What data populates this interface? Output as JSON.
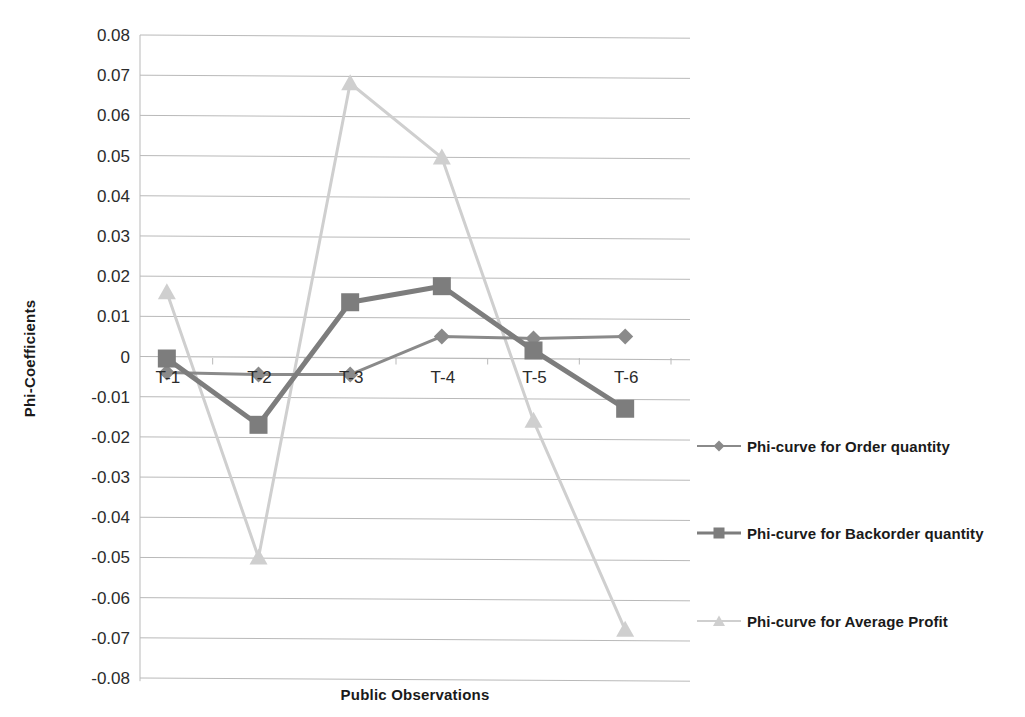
{
  "chart_data": {
    "type": "line",
    "title": "",
    "xlabel": "Public Observations",
    "ylabel": "Phi-Coefficients",
    "categories": [
      "T-1",
      "T-2",
      "T-3",
      "T-4",
      "T-5",
      "T-6"
    ],
    "ylim": [
      -0.08,
      0.08
    ],
    "ytick_labels": [
      "0.08",
      "0.07",
      "0.06",
      "0.05",
      "0.04",
      "0.03",
      "0.02",
      "0.01",
      "0",
      "-0.01",
      "-0.02",
      "-0.03",
      "-0.04",
      "-0.05",
      "-0.06",
      "-0.07",
      "-0.08"
    ],
    "ytick_values": [
      0.08,
      0.07,
      0.06,
      0.05,
      0.04,
      0.03,
      0.02,
      0.01,
      0,
      -0.01,
      -0.02,
      -0.03,
      -0.04,
      -0.05,
      -0.06,
      -0.07,
      -0.08
    ],
    "grid": true,
    "legend_position": "right",
    "series": [
      {
        "name": "Phi-curve for Order quantity",
        "marker": "diamond",
        "color": "#8a8a8a",
        "line_width": 3,
        "values": [
          -0.004,
          -0.0045,
          -0.0045,
          0.005,
          0.0045,
          0.005
        ]
      },
      {
        "name": "Phi-curve for Backorder quantity",
        "marker": "square",
        "color": "#7d7d7d",
        "line_width": 5,
        "values": [
          -0.0005,
          -0.017,
          0.0135,
          0.0175,
          0.0015,
          -0.013
        ]
      },
      {
        "name": "Phi-curve for Average Profit",
        "marker": "triangle",
        "color": "#cfcfcf",
        "line_width": 3,
        "values": [
          0.016,
          -0.05,
          0.068,
          0.0495,
          -0.016,
          -0.068
        ]
      }
    ]
  },
  "axis": {
    "x_title": "Public Observations",
    "y_title": "Phi-Coefficients"
  },
  "legend": {
    "entries": [
      {
        "label": "Phi-curve for Order quantity"
      },
      {
        "label": "Phi-curve for Backorder quantity"
      },
      {
        "label": "Phi-curve for Average Profit"
      }
    ]
  },
  "colors": {
    "gridline": "#b9b9b9",
    "axis_text": "#2b2b2b",
    "title_text": "#1a1a1a",
    "series_order_quantity": "#8a8a8a",
    "series_backorder_quantity": "#7d7d7d",
    "series_average_profit": "#cfcfcf"
  }
}
